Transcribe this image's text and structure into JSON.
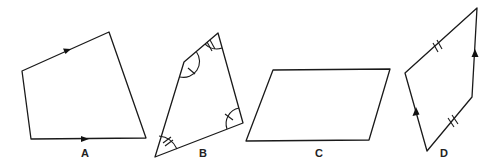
{
  "figure": {
    "shapes": [
      {
        "id": "A",
        "label": "A",
        "label_pos": [
          85,
          150
        ],
        "vertices": [
          [
            22,
            71
          ],
          [
            109,
            32
          ],
          [
            146,
            138
          ],
          [
            31,
            139
          ]
        ],
        "markings": "one pair of parallel sides marked with arrows (top and bottom)"
      },
      {
        "id": "B",
        "label": "B",
        "label_pos": [
          202,
          150
        ],
        "vertices": [
          [
            184,
            62
          ],
          [
            218,
            33
          ],
          [
            243,
            123
          ],
          [
            155,
            157
          ]
        ],
        "markings": "opposite angles marked equal: single-tick arcs at left and right, double-tick arcs at top and bottom"
      },
      {
        "id": "C",
        "label": "C",
        "label_pos": [
          318,
          150
        ],
        "vertices": [
          [
            273,
            70
          ],
          [
            390,
            69
          ],
          [
            369,
            140
          ],
          [
            246,
            141
          ]
        ],
        "markings": "none"
      },
      {
        "id": "D",
        "label": "D",
        "label_pos": [
          444,
          150
        ],
        "vertices": [
          [
            405,
            73
          ],
          [
            477,
            8
          ],
          [
            472,
            97
          ],
          [
            427,
            151
          ]
        ],
        "markings": "one pair of sides marked parallel with arrows (left and right), the other pair marked equal with double ticks"
      }
    ]
  }
}
